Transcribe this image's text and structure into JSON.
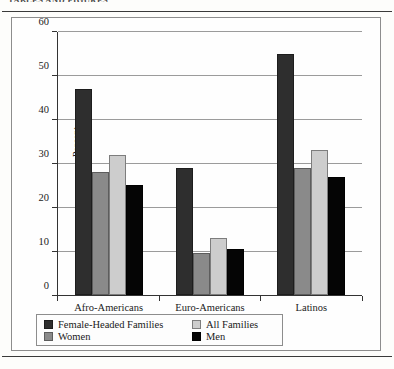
{
  "page": {
    "running_head": "TABLES AND FIGURES"
  },
  "chart_data": {
    "type": "bar",
    "title": "",
    "xlabel": "",
    "ylabel": "Percent",
    "ylim": [
      0,
      60
    ],
    "yticks": [
      0,
      10,
      20,
      30,
      40,
      50,
      60
    ],
    "ytick_labels": [
      "0",
      "10",
      "20",
      "30",
      "40",
      "50",
      "60"
    ],
    "grid": true,
    "legend_position": "below",
    "categories": [
      "Afro-Americans",
      "Euro-Americans",
      "Latinos"
    ],
    "series": [
      {
        "name": "Female-Headed Families",
        "color": "#2e2e2e",
        "values": [
          47,
          29,
          55
        ]
      },
      {
        "name": "Women",
        "color": "#8a8a8a",
        "values": [
          28,
          9.5,
          29
        ]
      },
      {
        "name": "All Families",
        "color": "#cdcdcd",
        "values": [
          32,
          13,
          33
        ]
      },
      {
        "name": "Men",
        "color": "#050505",
        "values": [
          25,
          10.5,
          27
        ]
      }
    ],
    "legend_order": [
      "Female-Headed Families",
      "All Families",
      "Women",
      "Men"
    ]
  }
}
